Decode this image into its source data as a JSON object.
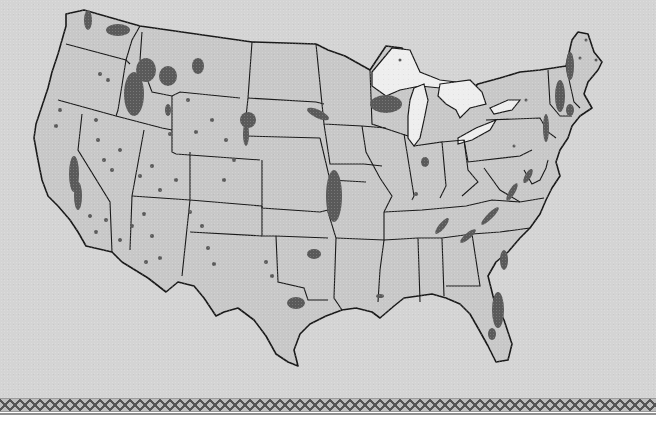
{
  "map": {
    "subject": "contiguous-united-states",
    "style": "grayscale thematic map with state outlines",
    "colors": {
      "background": "#d4d4d4",
      "land": "#c8c8c8",
      "state_border": "#1a1a1a",
      "shaded_regions": "#5a5a5a",
      "great_lakes": "#eeeeee",
      "border_band": "#555555",
      "page": "#ffffff"
    },
    "legend": null,
    "title": null,
    "labels": []
  },
  "decor": {
    "bottom_border": "diamond-pattern-band"
  }
}
